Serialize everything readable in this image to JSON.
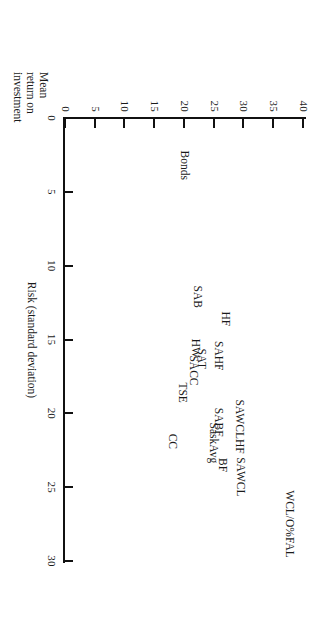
{
  "figure": {
    "background_color": "#ffffff",
    "ink_color": "#111111",
    "orientation": "rotated-90-clockwise"
  },
  "chart_data": {
    "type": "scatter",
    "title": "",
    "subtitle": "",
    "xlabel": "Risk (standard deviation)",
    "ylabel": "Mean return on investment",
    "ylabel_lines": [
      "Mean",
      "return on",
      "investment"
    ],
    "xlim": [
      0,
      30
    ],
    "ylim": [
      0,
      40
    ],
    "xticks": [
      0,
      5,
      10,
      15,
      20,
      25,
      30
    ],
    "xticklabels": [
      "0",
      "5",
      "10",
      "15",
      "20",
      "25",
      "30"
    ],
    "yticks": [
      0,
      5,
      10,
      15,
      20,
      25,
      30,
      35,
      40
    ],
    "yticklabels": [
      "0",
      "5",
      "10",
      "15",
      "20",
      "25",
      "30",
      "35",
      "40"
    ],
    "grid": false,
    "legend": "none",
    "marker_style": "text-label-only",
    "points": [
      {
        "label": "WCL/O%FAL",
        "x": 27.5,
        "y": 37.8
      },
      {
        "label": "SAWCL",
        "x": 24.3,
        "y": 29.6
      },
      {
        "label": "BF",
        "x": 23.5,
        "y": 26.6
      },
      {
        "label": "SaskAvg",
        "x": 22.0,
        "y": 25.0
      },
      {
        "label": "SAWCLHF",
        "x": 20.9,
        "y": 29.4
      },
      {
        "label": "SABF",
        "x": 20.6,
        "y": 25.9
      },
      {
        "label": "CC",
        "x": 21.9,
        "y": 18.2
      },
      {
        "label": "TSE",
        "x": 18.6,
        "y": 19.8
      },
      {
        "label": "SACC",
        "x": 17.1,
        "y": 21.6
      },
      {
        "label": "SAHF",
        "x": 16.1,
        "y": 25.8
      },
      {
        "label": "SAT",
        "x": 16.3,
        "y": 23.0
      },
      {
        "label": "HW",
        "x": 15.6,
        "y": 22.1
      },
      {
        "label": "HF",
        "x": 13.6,
        "y": 27.0
      },
      {
        "label": "SAB",
        "x": 12.1,
        "y": 22.4
      },
      {
        "label": "Bonds",
        "x": 3.2,
        "y": 20.2
      }
    ]
  }
}
